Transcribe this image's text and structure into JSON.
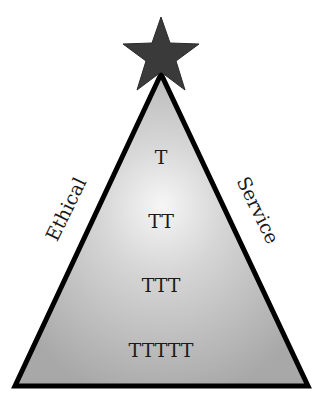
{
  "diagram": {
    "type": "pyramid",
    "apex_symbol": "star-icon",
    "side_labels": {
      "left": "Ethical",
      "right": "Service"
    },
    "tiers": [
      {
        "label": "T"
      },
      {
        "label": "TT"
      },
      {
        "label": "TTT"
      },
      {
        "label": "TTTTT"
      }
    ],
    "colors": {
      "star": "#3a3a3a",
      "triangle_fill_center": "#f4f4f4",
      "triangle_fill_edge": "#a9a9a9",
      "outline": "#000000",
      "text": "#1a1a1a"
    }
  }
}
